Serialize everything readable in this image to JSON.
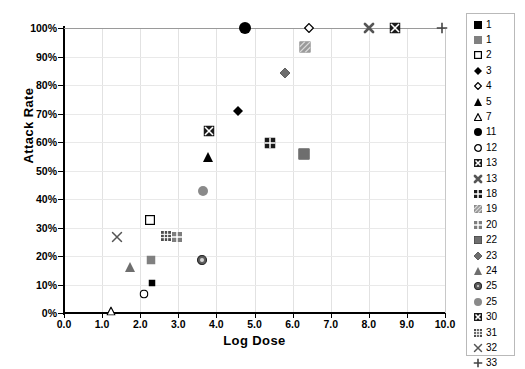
{
  "chart_data": {
    "type": "scatter",
    "title": "",
    "xlabel": "Log Dose",
    "ylabel": "Attack Rate",
    "xlim": [
      0.0,
      10.0
    ],
    "ylim": [
      0,
      100
    ],
    "xticks": [
      "0.0",
      "1.0",
      "2.0",
      "3.0",
      "4.0",
      "5.0",
      "6.0",
      "7.0",
      "8.0",
      "9.0",
      "10.0"
    ],
    "yticks": [
      "0%",
      "10%",
      "20%",
      "30%",
      "40%",
      "50%",
      "60%",
      "70%",
      "80%",
      "90%",
      "100%"
    ],
    "grid": true,
    "legend_position": "right",
    "series": [
      {
        "name": "1",
        "label": "1",
        "marker": "square-filled-small",
        "color": "#000000",
        "points": [
          {
            "x": 2.3,
            "y": 10.5
          }
        ]
      },
      {
        "name": "1b",
        "label": "1",
        "marker": "square-gray",
        "color": "#808080",
        "points": [
          {
            "x": 2.28,
            "y": 18.7
          }
        ]
      },
      {
        "name": "2",
        "label": "2",
        "marker": "square-open",
        "color": "#000000",
        "points": [
          {
            "x": 2.25,
            "y": 32.5
          }
        ]
      },
      {
        "name": "3",
        "label": "3",
        "marker": "diamond-filled",
        "color": "#000000",
        "points": [
          {
            "x": 4.56,
            "y": 70.8
          }
        ]
      },
      {
        "name": "4",
        "label": "4",
        "marker": "diamond-open",
        "color": "#000000",
        "points": [
          {
            "x": 6.43,
            "y": 100.0
          }
        ]
      },
      {
        "name": "5",
        "label": "5",
        "marker": "triangle-filled",
        "color": "#000000",
        "points": [
          {
            "x": 3.78,
            "y": 54.8
          }
        ]
      },
      {
        "name": "7",
        "label": "7",
        "marker": "triangle-open",
        "color": "#000000",
        "points": [
          {
            "x": 1.23,
            "y": 0.6
          }
        ]
      },
      {
        "name": "11",
        "label": "11",
        "marker": "circle-filled",
        "color": "#000000",
        "points": [
          {
            "x": 4.75,
            "y": 100.0
          }
        ]
      },
      {
        "name": "12",
        "label": "12",
        "marker": "circle-open",
        "color": "#000000",
        "points": [
          {
            "x": 2.1,
            "y": 6.8
          }
        ]
      },
      {
        "name": "13",
        "label": "13",
        "marker": "square-x-box",
        "color": "#1a1a1a",
        "points": [
          {
            "x": 8.7,
            "y": 100.0
          }
        ]
      },
      {
        "name": "13b",
        "label": "13",
        "marker": "x-bold",
        "color": "#555555",
        "points": [
          {
            "x": 8.0,
            "y": 100.0
          }
        ]
      },
      {
        "name": "18",
        "label": "18",
        "marker": "square-quad-dark",
        "color": "#1a1a1a",
        "points": [
          {
            "x": 5.4,
            "y": 59.8
          }
        ]
      },
      {
        "name": "19",
        "label": "19",
        "marker": "square-hatch-light",
        "color": "#9a9a9a",
        "points": [
          {
            "x": 6.32,
            "y": 93.5
          }
        ]
      },
      {
        "name": "20",
        "label": "20",
        "marker": "square-quad-gray",
        "color": "#7d7d7d",
        "points": [
          {
            "x": 2.97,
            "y": 26.5
          }
        ]
      },
      {
        "name": "22",
        "label": "22",
        "marker": "square-gray-solid",
        "color": "#6e6e6e",
        "points": [
          {
            "x": 6.3,
            "y": 55.8
          }
        ]
      },
      {
        "name": "23",
        "label": "23",
        "marker": "diamond-gray",
        "color": "#6e6e6e",
        "points": [
          {
            "x": 5.8,
            "y": 84.3
          }
        ]
      },
      {
        "name": "24",
        "label": "24",
        "marker": "triangle-gray",
        "color": "#6e6e6e",
        "points": [
          {
            "x": 1.72,
            "y": 16.0
          }
        ]
      },
      {
        "name": "25",
        "label": "25",
        "marker": "circle-ring-gray",
        "color": "#5e5e5e",
        "points": [
          {
            "x": 3.62,
            "y": 18.6
          }
        ]
      },
      {
        "name": "25b",
        "label": "25",
        "marker": "circle-gray",
        "color": "#8a8a8a",
        "points": [
          {
            "x": 3.65,
            "y": 42.8
          }
        ]
      },
      {
        "name": "30",
        "label": "30",
        "marker": "square-x-box",
        "color": "#1a1a1a",
        "points": [
          {
            "x": 3.8,
            "y": 63.8
          }
        ]
      },
      {
        "name": "31",
        "label": "31",
        "marker": "square-grid-gray",
        "color": "#4d4d4d",
        "points": [
          {
            "x": 2.67,
            "y": 27.0
          }
        ]
      },
      {
        "name": "32",
        "label": "32",
        "marker": "x-thin",
        "color": "#555555",
        "points": [
          {
            "x": 1.4,
            "y": 26.8
          }
        ]
      },
      {
        "name": "33",
        "label": "33",
        "marker": "plus",
        "color": "#444444",
        "points": [
          {
            "x": 9.92,
            "y": 100.0
          }
        ]
      }
    ]
  }
}
